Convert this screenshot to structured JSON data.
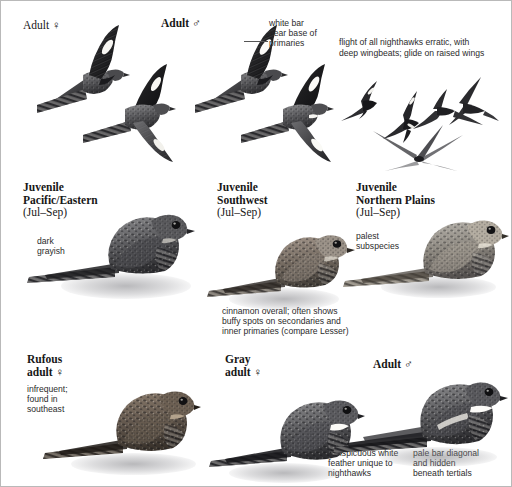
{
  "plate": {
    "title": "Common Nighthawk plumages and flight",
    "background_color": "#ffffff",
    "border_color": "#b9b9b9",
    "ink_color": "#171717"
  },
  "labels": {
    "adult_female_flight": "Adult ♀",
    "adult_male_flight": "Adult ♂",
    "juvenile_pacific_eastern": "Juvenile\nPacific/Eastern",
    "juvenile_pacific_eastern_date": "(Jul–Sep)",
    "juvenile_southwest": "Juvenile\nSouthwest",
    "juvenile_southwest_date": "(Jul–Sep)",
    "juvenile_northern_plains": "Juvenile\nNorthern Plains",
    "juvenile_northern_plains_date": "(Jul–Sep)",
    "rufous_adult_female": "Rufous\nadult ♀",
    "gray_adult_female": "Gray\nadult ♀",
    "adult_male_perched": "Adult ♂"
  },
  "annotations": {
    "white_bar": "white bar\nnear base of\nprimaries",
    "flight_behavior": "flight of all nighthawks erratic, with\ndeep wingbeats; glide on raised wings",
    "dark_grayish": "dark\ngrayish",
    "palest_subspecies": "palest\nsubspecies",
    "cinnamon_overall": "cinnamon overall; often shows\nbuffy spots on secondaries and\ninner primaries (compare Lesser)",
    "infrequent_southeast": "infrequent;\nfound in\nsoutheast",
    "white_feather": "conspicuous white\nfeather unique to\nnighthawks",
    "pale_bar": "pale bar diagonal\nand hidden\nbeneath tertials"
  },
  "figures": {
    "flight_adult_female_upper": "flying-nighthawk-upperside",
    "flight_adult_female_lower": "flying-nighthawk-underside",
    "flight_adult_male_upper": "flying-nighthawk-male-upperside",
    "flight_adult_male_lower": "flying-nighthawk-male-underside",
    "silhouette_1": "nighthawk-silhouette-gliding",
    "silhouette_2": "nighthawk-silhouette-banking",
    "silhouette_3": "nighthawk-silhouette-level",
    "silhouette_4": "nighthawk-silhouette-raised-wings",
    "silhouette_5": "nighthawk-silhouette-deep-wingbeat",
    "perched_juv_pacific": "perched-juvenile-pacific-eastern",
    "perched_juv_southwest": "perched-juvenile-southwest",
    "perched_juv_northern": "perched-juvenile-northern-plains",
    "perched_rufous_female": "perched-rufous-adult-female",
    "perched_gray_female": "perched-gray-adult-female",
    "perched_adult_male": "perched-adult-male"
  }
}
